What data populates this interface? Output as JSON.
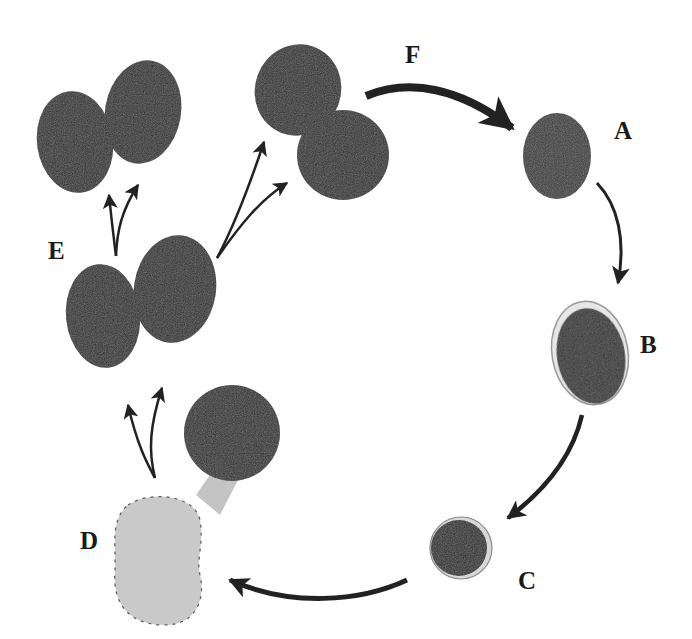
{
  "labels": {
    "A": "A",
    "B": "B",
    "C": "C",
    "D": "D",
    "E": "E",
    "F": "F"
  },
  "colors": {
    "cell_dark": "#2b2b2b",
    "cell_mid": "#3a3a3a",
    "cell_light": "#c9c9c9",
    "arrow": "#222222",
    "background": "#ffffff"
  },
  "stages": [
    {
      "id": "A",
      "description": "single cell, textured"
    },
    {
      "id": "B",
      "description": "single cell with halo"
    },
    {
      "id": "C",
      "description": "small round cell"
    },
    {
      "id": "D",
      "description": "dark cell budding from pale cell"
    },
    {
      "id": "E",
      "description": "two-cell pair dividing into further pairs"
    },
    {
      "id": "F",
      "description": "transition back to A"
    }
  ]
}
